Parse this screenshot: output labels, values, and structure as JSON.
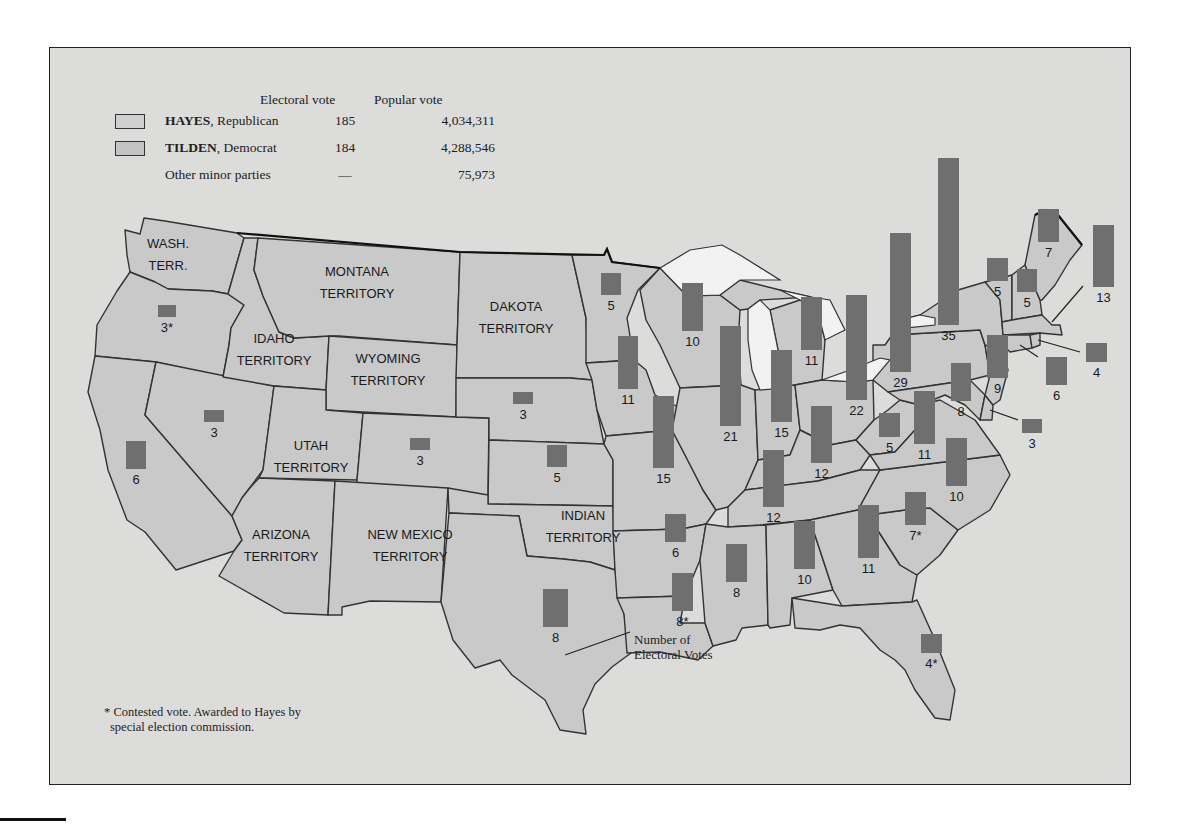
{
  "legend": {
    "headers": {
      "electoral": "Electoral vote",
      "popular": "Popular vote"
    },
    "rows": [
      {
        "name_bold": "HAYES",
        "name_rest": ", Republican",
        "electoral": "185",
        "popular": "4,034,311",
        "swatch": "#d2d2d2"
      },
      {
        "name_bold": "TILDEN",
        "name_rest": ", Democrat",
        "electoral": "184",
        "popular": "4,288,546",
        "swatch": "#c6c6c6"
      },
      {
        "name_bold": "",
        "name_rest": "Other minor parties",
        "electoral": "—",
        "popular": "75,973",
        "swatch": ""
      }
    ]
  },
  "footnote": {
    "line1": "* Contested vote. Awarded to Hayes by",
    "line2": "special election commission."
  },
  "callout": {
    "line1": "Number of",
    "line2": "Electoral Votes"
  },
  "colors": {
    "background": "#dcdcda",
    "state_fill": "#c9c9c9",
    "bar_fill": "#6f6f6f",
    "lakes": "#f2f2f2",
    "border": "#333333"
  },
  "territories": [
    {
      "label": [
        "WASH.",
        "TERR."
      ],
      "x": 168,
      "y": 248
    },
    {
      "label": [
        "MONTANA",
        "TERRITORY"
      ],
      "x": 357,
      "y": 276
    },
    {
      "label": [
        "IDAHO",
        "TERRITORY"
      ],
      "x": 274,
      "y": 343
    },
    {
      "label": [
        "WYOMING",
        "TERRITORY"
      ],
      "x": 388,
      "y": 363
    },
    {
      "label": [
        "DAKOTA",
        "TERRITORY"
      ],
      "x": 516,
      "y": 311
    },
    {
      "label": [
        "UTAH",
        "TERRITORY"
      ],
      "x": 311,
      "y": 450
    },
    {
      "label": [
        "ARIZONA",
        "TERRITORY"
      ],
      "x": 281,
      "y": 539
    },
    {
      "label": [
        "NEW MEXICO",
        "TERRITORY"
      ],
      "x": 410,
      "y": 539
    },
    {
      "label": [
        "INDIAN",
        "TERRITORY"
      ],
      "x": 583,
      "y": 520
    }
  ],
  "chart_data": {
    "type": "map-bar",
    "unit": "Electoral votes",
    "totals": {
      "Hayes": {
        "electoral": 185,
        "popular": 4034311
      },
      "Tilden": {
        "electoral": 184,
        "popular": 4288546
      },
      "Other minor parties": {
        "electoral": null,
        "popular": 75973
      }
    },
    "states": [
      {
        "state": "Oregon",
        "votes": 3,
        "label": "3*",
        "contested": true,
        "bx": 158,
        "by": 305,
        "w": 18,
        "h": 12
      },
      {
        "state": "California",
        "votes": 6,
        "label": "6",
        "bx": 126,
        "by": 441,
        "w": 20,
        "h": 28
      },
      {
        "state": "Nevada",
        "votes": 3,
        "label": "3",
        "bx": 204,
        "by": 410,
        "w": 20,
        "h": 12
      },
      {
        "state": "Colorado",
        "votes": 3,
        "label": "3",
        "bx": 410,
        "by": 438,
        "w": 20,
        "h": 12
      },
      {
        "state": "Nebraska",
        "votes": 3,
        "label": "3",
        "bx": 513,
        "by": 392,
        "w": 20,
        "h": 12
      },
      {
        "state": "Kansas",
        "votes": 5,
        "label": "5",
        "bx": 547,
        "by": 445,
        "w": 20,
        "h": 22
      },
      {
        "state": "Texas",
        "votes": 8,
        "label": "8",
        "bx": 543,
        "by": 589,
        "w": 25,
        "h": 38
      },
      {
        "state": "Minnesota",
        "votes": 5,
        "label": "5",
        "bx": 601,
        "by": 273,
        "w": 20,
        "h": 22
      },
      {
        "state": "Iowa",
        "votes": 11,
        "label": "11",
        "bx": 618,
        "by": 336,
        "w": 20,
        "h": 53
      },
      {
        "state": "Missouri",
        "votes": 15,
        "label": "15",
        "bx": 653,
        "by": 396,
        "w": 21,
        "h": 72
      },
      {
        "state": "Arkansas",
        "votes": 6,
        "label": "6",
        "bx": 665,
        "by": 514,
        "w": 21,
        "h": 28
      },
      {
        "state": "Louisiana",
        "votes": 8,
        "label": "8*",
        "contested": true,
        "bx": 672,
        "by": 573,
        "w": 21,
        "h": 38
      },
      {
        "state": "Wisconsin",
        "votes": 10,
        "label": "10",
        "bx": 682,
        "by": 283,
        "w": 21,
        "h": 48
      },
      {
        "state": "Illinois",
        "votes": 21,
        "label": "21",
        "bx": 720,
        "by": 326,
        "w": 21,
        "h": 100
      },
      {
        "state": "Mississippi",
        "votes": 8,
        "label": "8",
        "bx": 726,
        "by": 544,
        "w": 21,
        "h": 38
      },
      {
        "state": "Tennessee",
        "votes": 12,
        "label": "12",
        "bx": 763,
        "by": 450,
        "w": 21,
        "h": 57
      },
      {
        "state": "Indiana",
        "votes": 15,
        "label": "15",
        "bx": 771,
        "by": 350,
        "w": 21,
        "h": 72
      },
      {
        "state": "Alabama",
        "votes": 10,
        "label": "10",
        "bx": 794,
        "by": 521,
        "w": 21,
        "h": 48
      },
      {
        "state": "Michigan",
        "votes": 11,
        "label": "11",
        "bx": 801,
        "by": 297,
        "w": 21,
        "h": 53
      },
      {
        "state": "Kentucky",
        "votes": 12,
        "label": "12",
        "bx": 811,
        "by": 406,
        "w": 21,
        "h": 57
      },
      {
        "state": "Ohio",
        "votes": 22,
        "label": "22",
        "bx": 846,
        "by": 295,
        "w": 21,
        "h": 105
      },
      {
        "state": "Georgia",
        "votes": 11,
        "label": "11",
        "bx": 858,
        "by": 505,
        "w": 21,
        "h": 53
      },
      {
        "state": "Florida",
        "votes": 4,
        "label": "4*",
        "contested": true,
        "bx": 921,
        "by": 634,
        "w": 21,
        "h": 19
      },
      {
        "state": "West Virginia",
        "votes": 5,
        "label": "5",
        "bx": 879,
        "by": 413,
        "w": 21,
        "h": 24
      },
      {
        "state": "South Carolina",
        "votes": 7,
        "label": "7*",
        "contested": true,
        "bx": 905,
        "by": 492,
        "w": 21,
        "h": 33
      },
      {
        "state": "Pennsylvania",
        "votes": 29,
        "label": "29",
        "bx": 890,
        "by": 233,
        "w": 21,
        "h": 139
      },
      {
        "state": "Virginia",
        "votes": 11,
        "label": "11",
        "bx": 914,
        "by": 391,
        "w": 21,
        "h": 53
      },
      {
        "state": "New York",
        "votes": 35,
        "label": "35",
        "bx": 938,
        "by": 158,
        "w": 21,
        "h": 167
      },
      {
        "state": "North Carolina",
        "votes": 10,
        "label": "10",
        "bx": 946,
        "by": 438,
        "w": 21,
        "h": 48
      },
      {
        "state": "Maryland",
        "votes": 8,
        "label": "8",
        "bx": 951,
        "by": 363,
        "w": 20,
        "h": 38
      },
      {
        "state": "New Jersey",
        "votes": 9,
        "label": "9",
        "bx": 987,
        "by": 335,
        "w": 21,
        "h": 43
      },
      {
        "state": "Vermont",
        "votes": 5,
        "label": "5",
        "bx": 987,
        "by": 258,
        "w": 21,
        "h": 23
      },
      {
        "state": "New Hampshire",
        "votes": 5,
        "label": "5",
        "bx": 1017,
        "by": 269,
        "w": 20,
        "h": 23
      },
      {
        "state": "Delaware",
        "votes": 3,
        "label": "3",
        "bx": 1022,
        "by": 419,
        "w": 20,
        "h": 14
      },
      {
        "state": "Maine",
        "votes": 7,
        "label": "7",
        "bx": 1038,
        "by": 209,
        "w": 21,
        "h": 33
      },
      {
        "state": "Connecticut",
        "votes": 6,
        "label": "6",
        "bx": 1046,
        "by": 357,
        "w": 21,
        "h": 28
      },
      {
        "state": "Rhode Island",
        "votes": 4,
        "label": "4",
        "bx": 1086,
        "by": 343,
        "w": 21,
        "h": 19
      },
      {
        "state": "Massachusetts",
        "votes": 13,
        "label": "13",
        "bx": 1093,
        "by": 225,
        "w": 21,
        "h": 62
      }
    ],
    "legend": [
      "HAYES, Republican",
      "TILDEN, Democrat",
      "Other minor parties"
    ],
    "annotations": [
      "Number of Electoral Votes",
      "* Contested vote. Awarded to Hayes by special election commission."
    ]
  }
}
